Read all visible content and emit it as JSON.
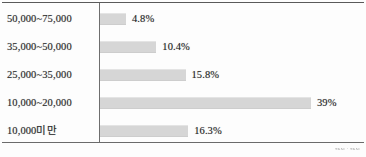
{
  "chart_data": {
    "type": "bar",
    "orientation": "horizontal",
    "title": "",
    "xlabel": "",
    "ylabel": "",
    "grid": false,
    "legend": null,
    "xlim": [
      0,
      39
    ],
    "categories": [
      "50,000~75,000",
      "35,000~50,000",
      "25,000~35,000",
      "10,000~20,000",
      "10,000미만"
    ],
    "values": [
      4.8,
      10.4,
      15.8,
      39,
      16.3
    ],
    "value_labels": [
      "4.8%",
      "10.4%",
      "15.8%",
      "39%",
      "16.3%"
    ],
    "bar_color": "#d6d6d6",
    "text_color": "#2e2e2e",
    "axis_color": "#6e6e6e"
  },
  "figure": {
    "caption": "ᴛᴋᴀɪ · ᴛᴋᴀɪ"
  }
}
